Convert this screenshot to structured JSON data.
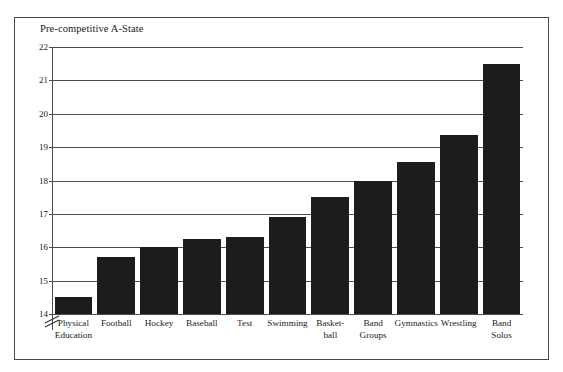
{
  "figure": {
    "title": "Pre-competitive A-State"
  },
  "chart_data": {
    "type": "bar",
    "title": "Pre-competitive A-State",
    "xlabel": "",
    "ylabel": "Pre-competitive A-State",
    "ylim": [
      14,
      22
    ],
    "yticks": [
      14,
      15,
      16,
      17,
      18,
      19,
      20,
      21,
      22
    ],
    "ytick_labels": [
      "14",
      "15",
      "16",
      "17",
      "18",
      "19",
      "20",
      "21",
      "22"
    ],
    "grid": true,
    "axis_break": true,
    "legend": false,
    "bar_color": "#1c1c1c",
    "categories": [
      "Physical Education",
      "Football",
      "Hockey",
      "Baseball",
      "Test",
      "Swimming",
      "Basket-ball",
      "Band Groups",
      "Gymnastics",
      "Wrestling",
      "Band Solos"
    ],
    "category_lines": [
      [
        "Physical",
        "Education"
      ],
      [
        "Football"
      ],
      [
        "Hockey"
      ],
      [
        "Baseball"
      ],
      [
        "Test"
      ],
      [
        "Swimming"
      ],
      [
        "Basket-",
        "ball"
      ],
      [
        "Band",
        "Groups"
      ],
      [
        "Gymnastics"
      ],
      [
        "Wrestling"
      ],
      [
        "Band",
        "Solos"
      ]
    ],
    "values": [
      14.5,
      15.7,
      16.0,
      16.25,
      16.3,
      16.9,
      17.5,
      18.0,
      18.55,
      19.35,
      21.5
    ]
  }
}
